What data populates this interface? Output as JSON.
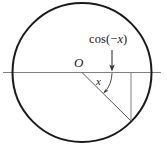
{
  "figure": {
    "labels": {
      "cosine_prefix": "cos(",
      "cosine_minus": "−",
      "cosine_variable": "x",
      "cosine_suffix": ")",
      "cosine_full": "cos(−x)",
      "origin": "O",
      "angle": "x"
    },
    "colors": {
      "circle_stroke": "#1a1a1a",
      "axis_stroke": "#777777",
      "radius_stroke": "#555555",
      "drop_line_stroke": "#777777",
      "arrow_stroke": "#333333",
      "arc_stroke": "#333333",
      "text": "#1a1a1a",
      "background": "#ffffff"
    },
    "geometry": {
      "circle_center_x": 82,
      "circle_center_y": 72.5,
      "circle_radius": 69.5,
      "circle_stroke_width": 2,
      "axis_y": 72.5,
      "axis_x_start": 3,
      "axis_x_end": 161,
      "point_x": 131,
      "point_y": 121,
      "drop_line_top_y": 72.5,
      "pointer_arrow_x": 112,
      "pointer_arrow_y_start": 50,
      "pointer_arrow_y_end": 70,
      "angle_arc_radius": 30,
      "angle_degrees": -44
    }
  }
}
